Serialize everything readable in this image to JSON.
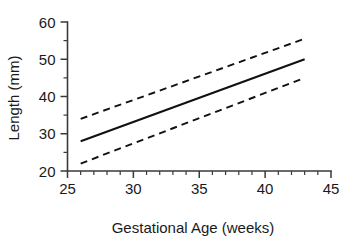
{
  "chart_data": {
    "type": "line",
    "title": "",
    "xlabel": "Gestational Age (weeks)",
    "ylabel": "Length (mm)",
    "xlim": [
      25,
      45
    ],
    "ylim": [
      20,
      60
    ],
    "grid": false,
    "legend": "none",
    "x_ticks_major": [
      25,
      30,
      35,
      40,
      45
    ],
    "x_tick_labels": [
      "25",
      "30",
      "35",
      "40",
      "45"
    ],
    "x_ticks_minor": [
      26,
      27,
      28,
      29,
      31,
      32,
      33,
      34,
      36,
      37,
      38,
      39,
      41,
      42,
      43,
      44
    ],
    "y_ticks_major": [
      20,
      30,
      40,
      50,
      60
    ],
    "y_tick_labels": [
      "20",
      "30",
      "40",
      "50",
      "60"
    ],
    "y_ticks_minor": [
      25,
      35,
      45,
      55
    ],
    "x": [
      26,
      43
    ],
    "series": [
      {
        "name": "upper-confidence-limit",
        "style": "dashed",
        "values": [
          34.0,
          55.5
        ]
      },
      {
        "name": "mean-regression-line",
        "style": "solid",
        "values": [
          28.0,
          50.0
        ]
      },
      {
        "name": "lower-confidence-limit",
        "style": "dashed",
        "values": [
          22.0,
          45.0
        ]
      }
    ],
    "colors": {
      "line": "#111111",
      "axis": "#3a3a3a",
      "text": "#1a1a1a",
      "background": "#ffffff"
    }
  }
}
